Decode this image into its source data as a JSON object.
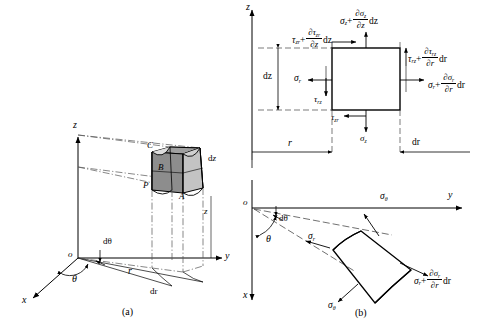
{
  "figure": {
    "captions": {
      "a": "(a)",
      "b": "(b)"
    }
  },
  "panel_a": {
    "axes": {
      "origin": "o",
      "x": "x",
      "y": "y",
      "z": "z"
    },
    "vertices": {
      "P": "P",
      "A": "A",
      "B": "B",
      "C": "C"
    },
    "dimensions": {
      "dtheta": "dθ",
      "theta": "θ",
      "r": "r",
      "dr": "dr",
      "dz": "dz",
      "z": "z"
    },
    "colors": {
      "face_light": "#c9c9c9",
      "face_mid": "#a9a9a9",
      "face_dark": "#8f8f8f",
      "line": "#000000"
    }
  },
  "panel_b_top": {
    "axes": {
      "z": "z"
    },
    "dimensions": {
      "dz": "dz",
      "r": "r",
      "dr": "dr"
    },
    "stresses": {
      "top_normal": {
        "base": "σ",
        "sub": "z",
        "plus": "+",
        "num_d": "∂σ",
        "num_sub": "z",
        "den": "∂z",
        "diff": "dz"
      },
      "top_shear": {
        "base": "τ",
        "sub": "zr",
        "plus": "+",
        "num_d": "∂τ",
        "num_sub": "zr",
        "den": "∂z",
        "diff": "dz"
      },
      "right_shear": {
        "base": "τ",
        "sub": "rz",
        "plus": "+",
        "num_d": "∂τ",
        "num_sub": "rz",
        "den": "∂r",
        "diff": "dr"
      },
      "right_normal": {
        "base": "σ",
        "sub": "r",
        "plus": "+",
        "num_d": "∂σ",
        "num_sub": "r",
        "den": "∂r",
        "diff": "dr"
      },
      "left_normal": {
        "base": "σ",
        "sub": "r"
      },
      "left_shear": {
        "base": "τ",
        "sub": "rz"
      },
      "bottom_shear": {
        "base": "τ",
        "sub": "zr"
      },
      "bottom_normal": {
        "base": "σ",
        "sub": "z"
      }
    }
  },
  "panel_b_bottom": {
    "axes": {
      "origin": "o",
      "x": "x",
      "y": "y"
    },
    "dimensions": {
      "dtheta": "dθ",
      "theta": "θ"
    },
    "stresses": {
      "sigma_r_inner": {
        "base": "σ",
        "sub": "r"
      },
      "sigma_theta_upper": {
        "base": "σ",
        "sub": "θ"
      },
      "sigma_theta_lower": {
        "base": "σ",
        "sub": "θ"
      },
      "sigma_r_outer": {
        "base": "σ",
        "sub": "r",
        "plus": "+",
        "num_d": "∂σ",
        "num_sub": "r",
        "den": "∂r",
        "diff": "dr"
      }
    }
  }
}
